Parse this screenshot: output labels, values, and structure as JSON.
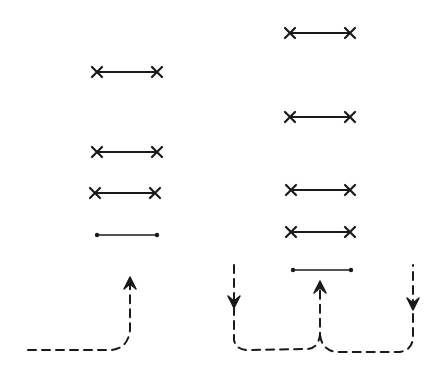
{
  "diagram": {
    "ink_color": "#1a1a1a",
    "background": "#ffffff",
    "left_column": {
      "segments": [
        {
          "x1": 97,
          "x2": 157,
          "y": 72,
          "ends": "cross"
        },
        {
          "x1": 97,
          "x2": 157,
          "y": 152,
          "ends": "cross"
        },
        {
          "x1": 95,
          "x2": 155,
          "y": 193,
          "ends": "cross"
        },
        {
          "x1": 97,
          "x2": 157,
          "y": 235,
          "ends": "dot"
        }
      ],
      "flows": [
        {
          "type": "dashed-arrow-up",
          "path": "M 28 350 L 112 350 Q 128 348 130 330 L 130 285",
          "arrow_at": [
            130,
            283
          ],
          "direction": "up"
        }
      ]
    },
    "right_column": {
      "segments": [
        {
          "x1": 290,
          "x2": 350,
          "y": 33,
          "ends": "cross"
        },
        {
          "x1": 290,
          "x2": 350,
          "y": 117,
          "ends": "cross"
        },
        {
          "x1": 291,
          "x2": 350,
          "y": 190,
          "ends": "cross"
        },
        {
          "x1": 291,
          "x2": 350,
          "y": 232,
          "ends": "cross"
        },
        {
          "x1": 293,
          "x2": 351,
          "y": 270,
          "ends": "dot"
        }
      ],
      "flows": [
        {
          "type": "dashed-arrow-down",
          "path": "M 234 265 L 234 340 Q 236 350 248 350 L 308 349 Q 318 348 320 335 L 320 290",
          "arrow_at": [
            234,
            302
          ],
          "direction": "down"
        },
        {
          "type": "dashed-arrow-up",
          "path": "M 320 335 Q 322 350 336 352 L 400 352 Q 412 350 413 338 L 413 265",
          "arrow_at": [
            320,
            287
          ],
          "direction": "up"
        },
        {
          "type": "dashed-arrow-down",
          "path": "",
          "arrow_at": [
            413,
            304
          ],
          "direction": "down"
        }
      ]
    }
  }
}
